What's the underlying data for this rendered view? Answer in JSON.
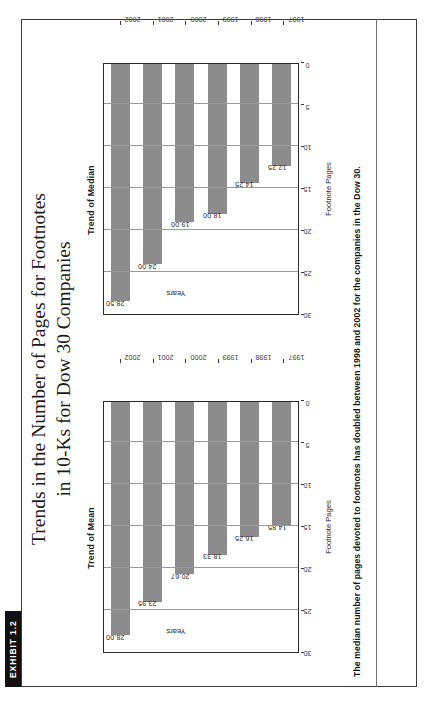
{
  "exhibit": {
    "tag": "EXHIBIT 1.2",
    "title_line1": "Trends in the Number of Pages for Footnotes",
    "title_line2": "in 10-Ks for Dow 30 Companies",
    "caption": "The median number of pages devoted to footnotes has doubled between 1998 and 2002 for the companies in the Dow 30.",
    "bar_color": "#8c8c8c",
    "frame_color": "#3c3c3c",
    "tag_background": "#111111"
  },
  "chart_data": [
    {
      "type": "bar",
      "orientation": "horizontal",
      "title": "Trend of Mean",
      "categories": [
        "1997",
        "1998",
        "1999",
        "2000",
        "2001",
        "2002"
      ],
      "values": [
        14.85,
        16.25,
        18.33,
        20.67,
        23.95,
        28.0
      ],
      "labels": [
        "14.85",
        "16.25",
        "18.33",
        "20.67",
        "23.95",
        "28.00"
      ],
      "xlabel": "Years",
      "ylabel": "Footnote Pages",
      "ylim": [
        0,
        30
      ],
      "yticks": [
        0,
        5,
        10,
        15,
        20,
        25,
        30
      ],
      "ytick_labels": [
        "0",
        "5",
        "10",
        "15",
        "20",
        "25",
        "30"
      ],
      "grid": true,
      "legend": "none"
    },
    {
      "type": "bar",
      "orientation": "horizontal",
      "title": "Trend of Median",
      "categories": [
        "1997",
        "1998",
        "1999",
        "2000",
        "2001",
        "2002"
      ],
      "values": [
        12.25,
        14.25,
        18.0,
        19.0,
        24.0,
        28.5
      ],
      "labels": [
        "12.25",
        "14.25",
        "18.00",
        "19.00",
        "24.00",
        "28.50"
      ],
      "xlabel": "Years",
      "ylabel": "Footnote Pages",
      "ylim": [
        0,
        30
      ],
      "yticks": [
        0,
        5,
        10,
        15,
        20,
        25,
        30
      ],
      "ytick_labels": [
        "0",
        "5",
        "10",
        "15",
        "20",
        "25",
        "30"
      ],
      "grid": true,
      "legend": "none"
    }
  ]
}
